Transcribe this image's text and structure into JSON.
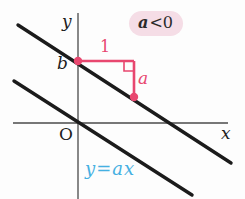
{
  "figure": {
    "type": "math-diagram",
    "labels": {
      "y_axis": "y",
      "x_axis": "x",
      "origin": "O",
      "y_intercept": "b",
      "run": "1",
      "rise": "a",
      "equation": "y=ax"
    },
    "condition_badge": {
      "variable": "a",
      "relation": "<0"
    },
    "colors": {
      "line_black": "#1b1b1b",
      "axis_gray": "#4a4a4a",
      "accent_pink": "#e8476f",
      "badge_background": "#f5dde6",
      "equation_cyan": "#45b0e2"
    }
  }
}
